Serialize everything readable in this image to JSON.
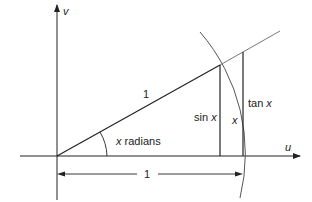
{
  "diagram": {
    "type": "unit-circle-trig-construction",
    "axes": {
      "horizontal_label": "u",
      "vertical_label": "v"
    },
    "labels": {
      "hypotenuse": "1",
      "angle_var": "x",
      "angle_unit": " radians",
      "sin_fn": "sin ",
      "sin_var": "x",
      "tan_fn": "tan ",
      "tan_var": "x",
      "arc_var": "x",
      "base_dimension": "1"
    },
    "colors": {
      "line": "#222222",
      "light_line": "#777777",
      "text": "#222222"
    }
  }
}
